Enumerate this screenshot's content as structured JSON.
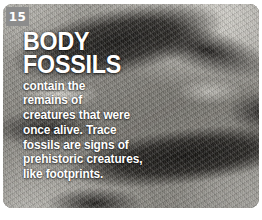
{
  "card": {
    "number_badge": "15",
    "title_line1": "BODY",
    "title_line2": "FOSSILS",
    "body_lines": [
      "contain the",
      "remains of",
      "creatures that were",
      "once alive. Trace",
      "fossils are signs of",
      "prehistoric creatures,",
      "like footprints."
    ],
    "colors": {
      "badge_background": "#8c8c8c",
      "text": "#ffffff",
      "page_background": "#ffffff"
    },
    "image_subject": "fossil-rock-texture"
  }
}
